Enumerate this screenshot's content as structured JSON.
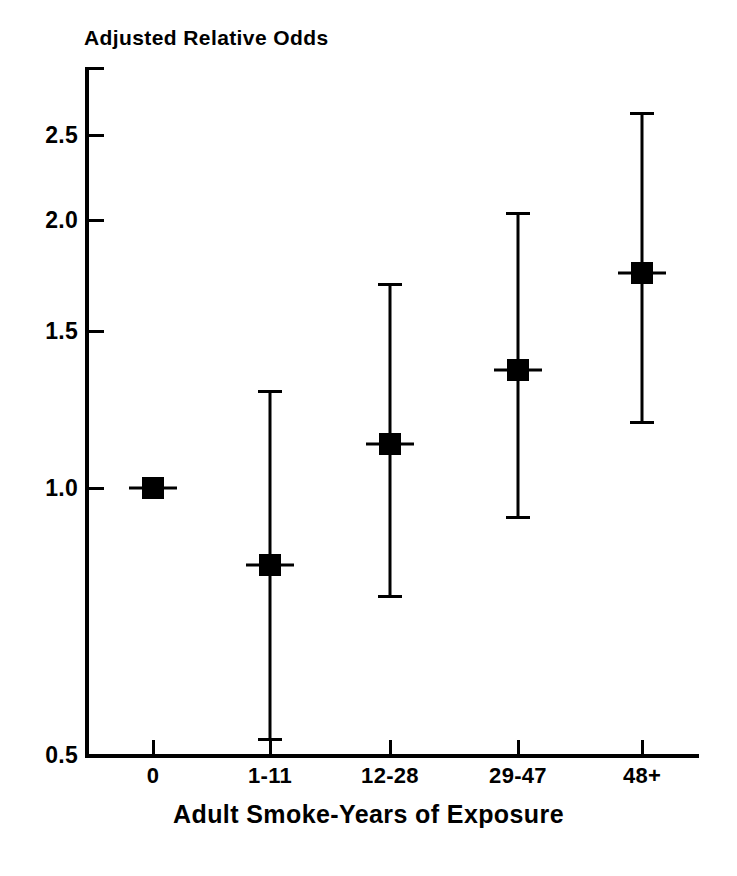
{
  "chart_data": {
    "type": "scatter",
    "title": "Adjusted Relative Odds",
    "xlabel": "Adult Smoke-Years of Exposure",
    "ylabel": "Adjusted Relative Odds",
    "categories": [
      "0",
      "1-11",
      "12-28",
      "29-47",
      "48+"
    ],
    "values": [
      1.0,
      0.83,
      1.13,
      1.37,
      1.76
    ],
    "ci_lower": [
      null,
      0.53,
      0.76,
      0.89,
      1.15
    ],
    "ci_upper": [
      null,
      1.3,
      1.7,
      2.04,
      2.58
    ],
    "ylim": [
      0.5,
      2.7
    ],
    "yticks": [
      0.5,
      1.0,
      1.5,
      2.0,
      2.5
    ],
    "ytick_labels": [
      "0.5",
      "1.0",
      "1.5",
      "2.0",
      "2.5"
    ],
    "grid": false,
    "legend": null,
    "marker": "filled-square"
  },
  "axes": {
    "y_title": "Adjusted Relative Odds",
    "x_title": "Adult Smoke-Years of Exposure",
    "y_ticks": [
      {
        "label": "2.5",
        "y_px": 135
      },
      {
        "label": "2.0",
        "y_px": 220
      },
      {
        "label": "1.5",
        "y_px": 331
      },
      {
        "label": "1.0",
        "y_px": 488
      },
      {
        "label": "0.5",
        "y_px": 755
      }
    ],
    "x_ticks": [
      {
        "label": "0",
        "x_px": 153
      },
      {
        "label": "1-11",
        "x_px": 270
      },
      {
        "label": "12-28",
        "x_px": 390
      },
      {
        "label": "29-47",
        "x_px": 518
      },
      {
        "label": "48+",
        "x_px": 642
      }
    ]
  },
  "points": [
    {
      "category": "0",
      "value": 1.0,
      "x_px": 153,
      "y_px": 488,
      "top_px": null,
      "bottom_px": null,
      "has_ci": false
    },
    {
      "category": "1-11",
      "value": 0.83,
      "x_px": 270,
      "y_px": 565,
      "top_px": 390,
      "bottom_px": 740,
      "has_ci": true
    },
    {
      "category": "12-28",
      "value": 1.13,
      "x_px": 390,
      "y_px": 444,
      "top_px": 283,
      "bottom_px": 597,
      "has_ci": true
    },
    {
      "category": "29-47",
      "value": 1.37,
      "x_px": 518,
      "y_px": 370,
      "top_px": 212,
      "bottom_px": 518,
      "has_ci": true
    },
    {
      "category": "48+",
      "value": 1.76,
      "x_px": 642,
      "y_px": 273,
      "top_px": 112,
      "bottom_px": 423,
      "has_ci": true
    }
  ],
  "colors": {
    "foreground": "#000000",
    "background": "#ffffff"
  }
}
